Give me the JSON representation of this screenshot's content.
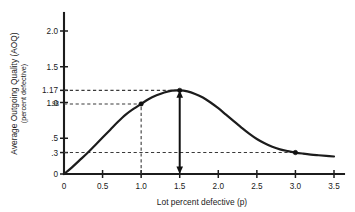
{
  "chart_data": {
    "type": "line",
    "title": "",
    "xlabel": "Lot percent defective (p)",
    "ylabel": "Average Outgoing Quality (AOQ)",
    "ylabel_sub": "(percent defective)",
    "xlim": [
      0,
      3.5
    ],
    "ylim": [
      0,
      2.2
    ],
    "grid": false,
    "legend": null,
    "x_ticks": [
      {
        "value": 0,
        "label": "0"
      },
      {
        "value": 0.5,
        "label": "0.5"
      },
      {
        "value": 1.0,
        "label": "1.0"
      },
      {
        "value": 1.5,
        "label": "1.5"
      },
      {
        "value": 2.0,
        "label": "2.0"
      },
      {
        "value": 2.5,
        "label": "2.5"
      },
      {
        "value": 3.0,
        "label": "3.0"
      },
      {
        "value": 3.5,
        "label": "3.5"
      }
    ],
    "y_ticks": [
      {
        "value": 2.0,
        "label": "2.0",
        "size": "normal"
      },
      {
        "value": 1.5,
        "label": "1.5",
        "size": "normal"
      },
      {
        "value": 1.17,
        "label": "1.17",
        "size": "normal"
      },
      {
        "value": 1.0,
        "label": "1.0",
        "size": "normal"
      },
      {
        "value": 0.98,
        "label": ".98",
        "size": "small"
      },
      {
        "value": 0.5,
        "label": ".5",
        "size": "normal"
      },
      {
        "value": 0.3,
        "label": ".3",
        "size": "normal"
      },
      {
        "value": 0.0,
        "label": "0",
        "size": "normal"
      }
    ],
    "series": [
      {
        "name": "AOQ curve",
        "x": [
          0.0,
          0.1,
          0.2,
          0.3,
          0.4,
          0.5,
          0.6,
          0.7,
          0.8,
          0.9,
          1.0,
          1.1,
          1.2,
          1.3,
          1.4,
          1.5,
          1.6,
          1.7,
          1.8,
          1.9,
          2.0,
          2.1,
          2.2,
          2.3,
          2.4,
          2.5,
          2.6,
          2.7,
          2.8,
          2.9,
          3.0,
          3.1,
          3.2,
          3.3,
          3.4,
          3.5
        ],
        "y": [
          0.0,
          0.09,
          0.19,
          0.29,
          0.4,
          0.51,
          0.62,
          0.73,
          0.83,
          0.91,
          0.98,
          1.05,
          1.1,
          1.14,
          1.165,
          1.17,
          1.155,
          1.12,
          1.07,
          1.0,
          0.92,
          0.83,
          0.74,
          0.65,
          0.565,
          0.49,
          0.43,
          0.38,
          0.345,
          0.32,
          0.3,
          0.285,
          0.272,
          0.262,
          0.253,
          0.245
        ]
      }
    ],
    "markers": [
      {
        "name": "aoq-at-p-1.0",
        "x": 1.0,
        "y": 0.98
      },
      {
        "name": "aoql-peak",
        "x": 1.5,
        "y": 1.17
      },
      {
        "name": "aoq-at-p-3.0",
        "x": 3.0,
        "y": 0.3
      }
    ],
    "guides": [
      {
        "name": "guide-h-0.98",
        "orientation": "horizontal",
        "value": 0.98,
        "from": 0.0,
        "to": 1.0
      },
      {
        "name": "guide-v-1.0",
        "orientation": "vertical",
        "value": 1.0,
        "from": 0.0,
        "to": 0.98
      },
      {
        "name": "guide-h-1.17",
        "orientation": "horizontal",
        "value": 1.17,
        "from": 0.0,
        "to": 1.5
      },
      {
        "name": "guide-h-0.3",
        "orientation": "horizontal",
        "value": 0.3,
        "from": 0.0,
        "to": 3.0
      }
    ],
    "annotations": [
      {
        "name": "aoql-double-arrow",
        "type": "double-headed-arrow",
        "x": 1.5,
        "y_from": 0.0,
        "y_to": 1.17
      }
    ],
    "colors": {
      "curve": "#1c1c1c",
      "axis": "#1c1c1c",
      "guide": "#3a3a3a",
      "background": "#ffffff"
    }
  }
}
